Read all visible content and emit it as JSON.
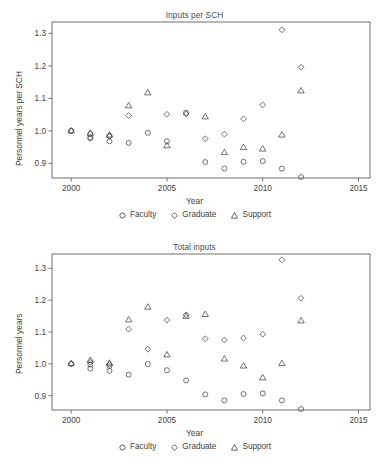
{
  "figure": {
    "background": "#ffffff",
    "ink": "#4d4d4d"
  },
  "legend": {
    "items": [
      {
        "label": "Faculty",
        "marker": "circle-icon"
      },
      {
        "label": "Graduate",
        "marker": "diamond-icon"
      },
      {
        "label": "Support",
        "marker": "triangle-icon"
      }
    ]
  },
  "axis": {
    "xlabel": "Year",
    "xticks": [
      "2000",
      "2005",
      "2010",
      "2015"
    ],
    "xtickvalues": [
      2000,
      2005,
      2010,
      2015
    ],
    "yticks": [
      "0.9",
      "1.0",
      "1.1",
      "1.2",
      "1.3"
    ],
    "ytickvalues": [
      0.9,
      1.0,
      1.1,
      1.2,
      1.3
    ]
  },
  "chart_data": [
    {
      "type": "scatter",
      "id": "inputs-per-sch",
      "title": "Inputs per SCH",
      "xlabel": "Year",
      "ylabel": "Personnel years per SCH",
      "xlim": [
        1999.0,
        2015.6
      ],
      "ylim": [
        0.855,
        1.335
      ],
      "grid": false,
      "legend_position": "bottom",
      "series": [
        {
          "name": "Faculty",
          "marker": "circle",
          "x": [
            2000,
            2001,
            2001,
            2002,
            2002,
            2003,
            2004,
            2005,
            2006,
            2007,
            2008,
            2009,
            2010,
            2011,
            2012
          ],
          "y": [
            1.0,
            0.99,
            0.977,
            0.985,
            0.968,
            0.963,
            0.994,
            0.968,
            1.056,
            0.904,
            0.884,
            0.905,
            0.907,
            0.884,
            0.858
          ]
        },
        {
          "name": "Graduate",
          "marker": "diamond",
          "x": [
            2000,
            2001,
            2002,
            2003,
            2005,
            2006,
            2007,
            2008,
            2009,
            2010,
            2011,
            2012
          ],
          "y": [
            1.0,
            0.98,
            0.983,
            1.047,
            1.051,
            1.052,
            0.976,
            0.99,
            1.037,
            1.08,
            1.311,
            1.196
          ]
        },
        {
          "name": "Support",
          "marker": "triangle",
          "x": [
            2000,
            2001,
            2002,
            2003,
            2004,
            2005,
            2007,
            2008,
            2009,
            2010,
            2011,
            2012
          ],
          "y": [
            1.001,
            0.994,
            0.988,
            1.078,
            1.118,
            0.955,
            1.044,
            0.934,
            0.95,
            0.945,
            0.988,
            1.124
          ]
        }
      ]
    },
    {
      "type": "scatter",
      "id": "total-inputs",
      "title": "Total inputs",
      "xlabel": "Year",
      "ylabel": "Personnel years",
      "xlim": [
        1999.0,
        2015.6
      ],
      "ylim": [
        0.855,
        1.345
      ],
      "grid": false,
      "legend_position": "bottom",
      "series": [
        {
          "name": "Faculty",
          "marker": "circle",
          "x": [
            2000,
            2001,
            2001,
            2002,
            2002,
            2003,
            2004,
            2005,
            2006,
            2007,
            2008,
            2009,
            2010,
            2011,
            2012
          ],
          "y": [
            1.0,
            0.998,
            0.985,
            0.993,
            0.978,
            0.966,
            0.999,
            0.98,
            0.948,
            0.904,
            0.885,
            0.905,
            0.907,
            0.885,
            0.858
          ]
        },
        {
          "name": "Graduate",
          "marker": "diamond",
          "x": [
            2000,
            2001,
            2002,
            2003,
            2004,
            2005,
            2006,
            2007,
            2008,
            2009,
            2010,
            2011,
            2012
          ],
          "y": [
            1.0,
            1.005,
            0.998,
            1.109,
            1.046,
            1.137,
            1.154,
            1.079,
            1.075,
            1.081,
            1.093,
            1.327,
            1.206
          ]
        },
        {
          "name": "Support",
          "marker": "triangle",
          "x": [
            2000,
            2001,
            2002,
            2003,
            2004,
            2005,
            2006,
            2007,
            2008,
            2009,
            2010,
            2011,
            2012
          ],
          "y": [
            1.002,
            1.012,
            1.003,
            1.139,
            1.179,
            1.029,
            1.15,
            1.156,
            1.016,
            0.994,
            0.957,
            1.002,
            1.136
          ]
        }
      ]
    }
  ]
}
